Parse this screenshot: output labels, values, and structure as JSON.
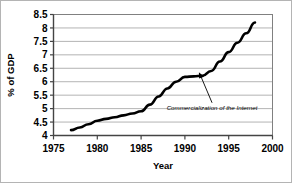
{
  "chart_data": {
    "type": "line",
    "title": "",
    "xlabel": "Year",
    "ylabel": "% of GDP",
    "xlim": [
      1975,
      2000
    ],
    "ylim": [
      4,
      8.5
    ],
    "grid": "horizontal",
    "legend": "none",
    "x_ticks": [
      "1975",
      "1980",
      "1985",
      "1990",
      "1995",
      "2000"
    ],
    "x_tick_values": [
      1975,
      1980,
      1985,
      1990,
      1995,
      2000
    ],
    "y_ticks": [
      "4",
      "4.5",
      "5",
      "5.5",
      "6",
      "6.5",
      "7",
      "7.5",
      "8",
      "8.5"
    ],
    "y_tick_values": [
      4,
      4.5,
      5,
      5.5,
      6,
      6.5,
      7,
      7.5,
      8,
      8.5
    ],
    "x": [
      1977,
      1978,
      1979,
      1980,
      1981,
      1982,
      1983,
      1984,
      1985,
      1986,
      1987,
      1988,
      1989,
      1990,
      1991,
      1992,
      1993,
      1994,
      1995,
      1996,
      1997,
      1998
    ],
    "values": [
      4.2,
      4.3,
      4.42,
      4.55,
      4.62,
      4.68,
      4.75,
      4.82,
      4.9,
      5.15,
      5.45,
      5.75,
      6.0,
      6.18,
      6.2,
      6.22,
      6.4,
      6.75,
      7.1,
      7.45,
      7.8,
      8.2
    ],
    "series": [
      {
        "name": "% of GDP",
        "color": "#000000",
        "values": [
          4.2,
          4.3,
          4.42,
          4.55,
          4.62,
          4.68,
          4.75,
          4.82,
          4.9,
          5.15,
          5.45,
          5.75,
          6.0,
          6.18,
          6.2,
          6.22,
          6.4,
          6.75,
          7.1,
          7.45,
          7.8,
          8.2
        ]
      }
    ],
    "annotations": [
      {
        "text": "Commercialization of the Internet",
        "target_x": 1991.6,
        "target_y": 6.35,
        "label_x": 1993.1,
        "label_y": 5.05
      }
    ]
  },
  "colors": {
    "line": "#000000",
    "grid": "#aaaaaa",
    "axis": "#555555",
    "frame": "#b4b4b4",
    "background": "#ffffff"
  }
}
